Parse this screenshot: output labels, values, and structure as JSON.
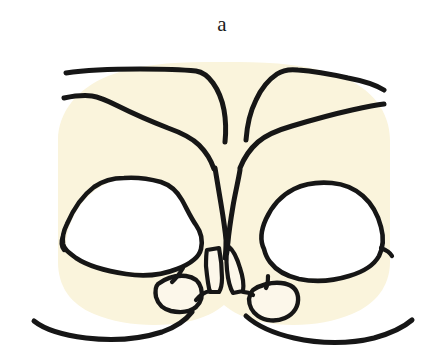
{
  "figure": {
    "panel_label": "a",
    "caption_position": "top-center",
    "background_color": "#ffffff",
    "fill_color": "#faf4dc",
    "cavity_color": "#ffffff",
    "stroke_color": "#161616",
    "tooth_fill_color": "#fcf7ea",
    "width": 444,
    "height": 363
  },
  "regions": [
    {
      "name": "soft-tissue-body",
      "role": "main-cream-mass",
      "fill": "#faf4dc",
      "outlined": false
    },
    {
      "name": "left-cavity",
      "role": "open-white-space-left",
      "fill": "#ffffff",
      "outlined": true
    },
    {
      "name": "right-cavity",
      "role": "open-white-space-right",
      "fill": "#ffffff",
      "outlined": true
    },
    {
      "name": "central-incisor-left",
      "role": "narrow-vertical-element",
      "fill": "#fcf7ea",
      "outlined": true
    },
    {
      "name": "central-incisor-right",
      "role": "narrow-vertical-element",
      "fill": "#fcf7ea",
      "outlined": true
    },
    {
      "name": "lateral-element-left",
      "role": "small-quadrilateral",
      "fill": "#fcf7ea",
      "outlined": true
    },
    {
      "name": "lateral-element-right",
      "role": "small-quadrilateral",
      "fill": "#fcf7ea",
      "outlined": true
    }
  ],
  "contour_lines": [
    {
      "name": "upper-left-outer-ridge",
      "side": "left"
    },
    {
      "name": "upper-left-inner-ridge",
      "side": "left"
    },
    {
      "name": "upper-right-outer-ridge",
      "side": "right"
    },
    {
      "name": "upper-right-inner-ridge",
      "side": "right"
    },
    {
      "name": "central-cleft-left-wall",
      "side": "center"
    },
    {
      "name": "central-cleft-right-wall",
      "side": "center"
    },
    {
      "name": "lower-left-border",
      "side": "left"
    },
    {
      "name": "lower-right-border",
      "side": "right"
    }
  ]
}
